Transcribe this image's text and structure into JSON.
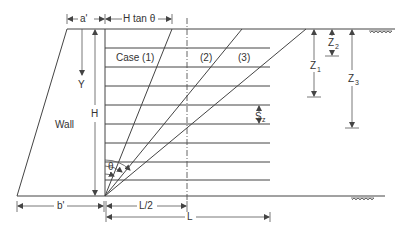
{
  "figure": {
    "type": "retaining-wall-reinforcement-diagram",
    "labels": {
      "a_prime": "a'",
      "h_tan_theta": "H tan θ",
      "y": "Y",
      "h": "H",
      "wall": "Wall",
      "case1": "Case (1)",
      "case2": "(2)",
      "case3": "(3)",
      "theta": "θ",
      "b_prime": "b'",
      "l_half": "L/2",
      "l": "L",
      "z1": "Z",
      "z1_sub": "1",
      "z2": "Z",
      "z2_sub": "2",
      "z3": "Z",
      "z3_sub": "3",
      "sz": "S",
      "sz_sub": "z"
    },
    "reinforcement_layers": 8,
    "colors": {
      "line": "#444444",
      "text": "#333333",
      "background": "#ffffff"
    }
  }
}
